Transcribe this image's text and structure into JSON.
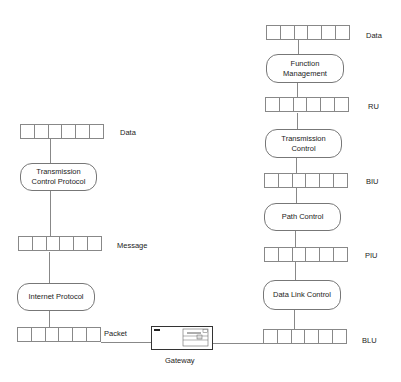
{
  "diagram": {
    "left_stack": {
      "buffers": [
        {
          "label": "Data",
          "cells": 6
        },
        {
          "label": "Message",
          "cells": 6
        },
        {
          "label": "Packet",
          "cells": 6
        }
      ],
      "processes": [
        {
          "label": "Transmission\nControl Protocol"
        },
        {
          "label": "Internet Protocol"
        }
      ]
    },
    "right_stack": {
      "buffers": [
        {
          "label": "Data",
          "cells": 6
        },
        {
          "label": "RU",
          "cells": 6
        },
        {
          "label": "BIU",
          "cells": 6
        },
        {
          "label": "PIU",
          "cells": 6
        },
        {
          "label": "BLU",
          "cells": 6
        }
      ],
      "processes": [
        {
          "label": "Function\nManagement"
        },
        {
          "label": "Transmission\nControl"
        },
        {
          "label": "Path Control"
        },
        {
          "label": "Data Link Control"
        }
      ]
    },
    "gateway": {
      "label": "Gateway",
      "icon": "computer-window-icon"
    }
  }
}
